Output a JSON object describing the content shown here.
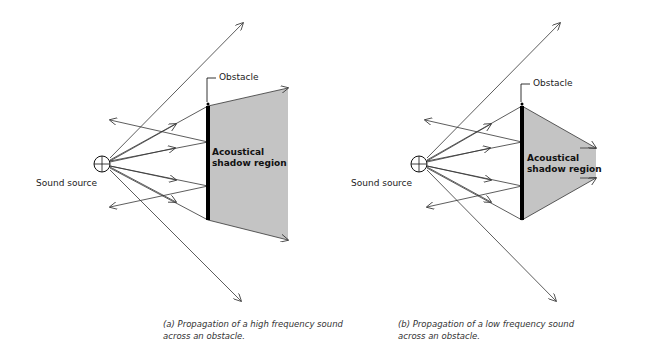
{
  "panels": [
    {
      "id": "a",
      "source_label": "Sound source",
      "obstacle_label": "Obstacle",
      "region_label_line1": "Acoustical",
      "region_label_line2": "shadow region",
      "caption_line1": "(a) Propagation of a high frequency sound",
      "caption_line2": "across an obstacle."
    },
    {
      "id": "b",
      "source_label": "Sound source",
      "obstacle_label": "Obstacle",
      "region_label_line1": "Acoustical",
      "region_label_line2": "shadow region",
      "caption_line1": "(b) Propagation of a low frequency sound",
      "caption_line2": "across an obstacle."
    }
  ],
  "colors": {
    "shadow_fill": "#c4c4c4",
    "line": "#333333",
    "obstacle": "#000000"
  }
}
